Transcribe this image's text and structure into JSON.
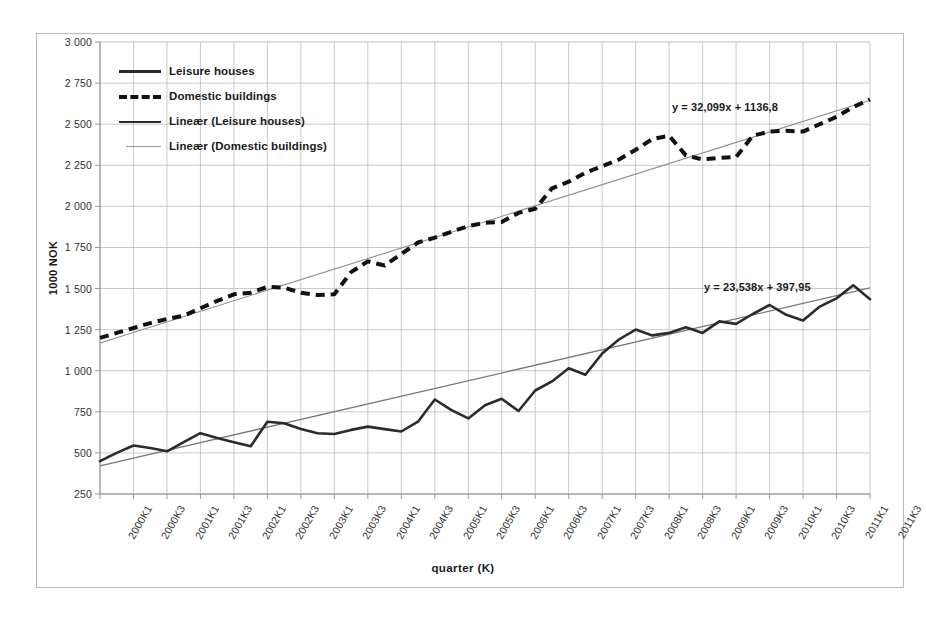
{
  "chart_data": {
    "type": "line",
    "title": "",
    "xlabel": "quarter  (K)",
    "ylabel": "1000 NOK",
    "ylim": [
      250,
      3000
    ],
    "ytick_step": 250,
    "grid": true,
    "legend_position": "top-left inside plot",
    "ytick_labels": [
      "3 000",
      "2 750",
      "2 500",
      "2 250",
      "2 000",
      "1 750",
      "1 500",
      "1 250",
      "1 000",
      "750",
      "500",
      "250"
    ],
    "ytick_values": [
      3000,
      2750,
      2500,
      2250,
      2000,
      1750,
      1500,
      1250,
      1000,
      750,
      500,
      250
    ],
    "categories": [
      "2000K1",
      "2000K2",
      "2000K3",
      "2000K4",
      "2001K1",
      "2001K2",
      "2001K3",
      "2001K4",
      "2002K1",
      "2002K2",
      "2002K3",
      "2002K4",
      "2003K1",
      "2003K2",
      "2003K3",
      "2003K4",
      "2004K1",
      "2004K2",
      "2004K3",
      "2004K4",
      "2005K1",
      "2005K2",
      "2005K3",
      "2005K4",
      "2006K1",
      "2006K2",
      "2006K3",
      "2006K4",
      "2007K1",
      "2007K2",
      "2007K3",
      "2007K4",
      "2008K1",
      "2008K2",
      "2008K3",
      "2008K4",
      "2009K1",
      "2009K2",
      "2009K3",
      "2009K4",
      "2010K1",
      "2010K2",
      "2010K3",
      "2010K4",
      "2011K1",
      "2011K2",
      "2011K3"
    ],
    "xtick_labels": [
      "2000K1",
      "2000K3",
      "2001K1",
      "2001K3",
      "2002K1",
      "2002K3",
      "2003K1",
      "2003K3",
      "2004K1",
      "2004K3",
      "2005K1",
      "2005K3",
      "2006K1",
      "2006K3",
      "2007K1",
      "2007K3",
      "2008K1",
      "2008K3",
      "2009K1",
      "2009K3",
      "2010K1",
      "2010K3",
      "2011K1",
      "2011K3"
    ],
    "series": [
      {
        "name": "Leisure houses",
        "style": "solid-thick",
        "color": "#2b2b2b",
        "values": [
          450,
          500,
          545,
          530,
          510,
          565,
          620,
          590,
          565,
          540,
          690,
          680,
          645,
          620,
          615,
          640,
          660,
          645,
          630,
          690,
          825,
          760,
          710,
          790,
          830,
          755,
          880,
          935,
          1015,
          975,
          1105,
          1190,
          1250,
          1215,
          1230,
          1265,
          1230,
          1300,
          1285,
          1345,
          1400,
          1340,
          1305,
          1390,
          1440,
          1520,
          1435
        ]
      },
      {
        "name": "Domestic buildings",
        "style": "dashed-thick",
        "color": "#111111",
        "values": [
          1200,
          1230,
          1260,
          1290,
          1315,
          1335,
          1380,
          1425,
          1465,
          1475,
          1510,
          1505,
          1475,
          1460,
          1465,
          1600,
          1665,
          1640,
          1710,
          1780,
          1810,
          1845,
          1880,
          1900,
          1905,
          1960,
          1985,
          2110,
          2150,
          2205,
          2245,
          2285,
          2345,
          2410,
          2430,
          2310,
          2285,
          2295,
          2300,
          2430,
          2455,
          2460,
          2455,
          2500,
          2545,
          2605,
          2650
        ]
      }
    ],
    "trendlines": [
      {
        "name": "Lineær (Domestic buildings)",
        "style": "solid-faint",
        "color": "#8f8f8f",
        "equation": "y = 32,099x + 1136,8",
        "slope": 32.099,
        "intercept": 1136.8,
        "legend_for": "Domestic buildings"
      },
      {
        "name": "Lineær (Leisure houses)",
        "style": "solid-thin",
        "color": "#7a7a7a",
        "equation": "y = 23,538x + 397,95",
        "slope": 23.538,
        "intercept": 397.95,
        "legend_for": "Leisure houses"
      }
    ],
    "legend_entries": [
      {
        "label": "Leisure houses",
        "style": "solid-thick"
      },
      {
        "label": "Domestic buildings",
        "style": "dashed-thick"
      },
      {
        "label": "Lineær (Leisure houses)",
        "style": "solid-thin"
      },
      {
        "label": "Lineær (Domestic buildings)",
        "style": "solid-faint"
      }
    ],
    "annotations": [
      {
        "text": "y = 32,099x + 1136,8",
        "x_px": 672,
        "y_px": 101
      },
      {
        "text": "y = 23,538x + 397,95",
        "x_px": 704,
        "y_px": 281
      }
    ]
  }
}
